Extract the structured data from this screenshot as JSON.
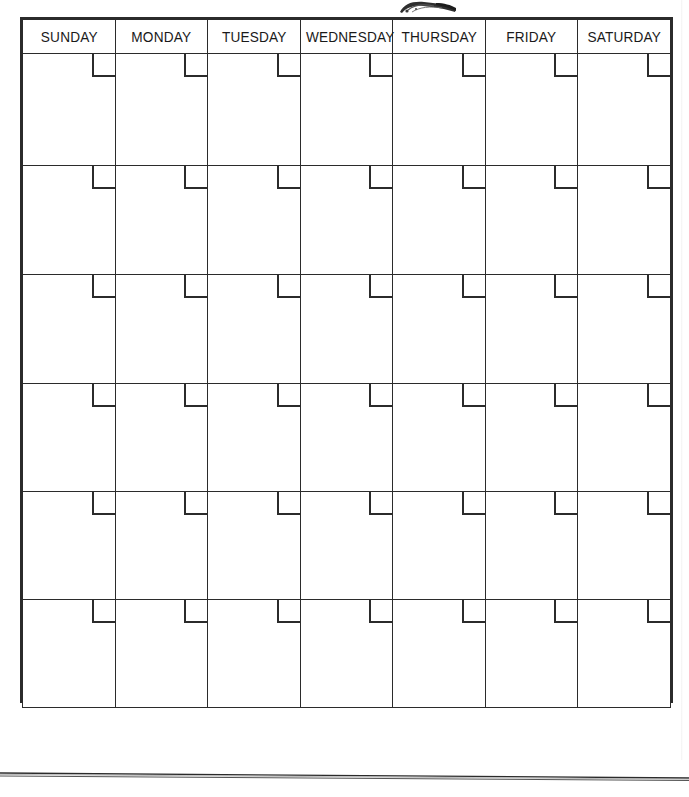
{
  "document": {
    "type": "blank-monthly-calendar",
    "title": "Blank Monthly Calendar Template"
  },
  "calendar": {
    "day_headers": [
      "SUNDAY",
      "MONDAY",
      "TUESDAY",
      "WEDNESDAY",
      "THURSDAY",
      "FRIDAY",
      "SATURDAY"
    ],
    "week_count": 6,
    "weeks": [
      {
        "cells": [
          "",
          "",
          "",
          "",
          "",
          "",
          ""
        ]
      },
      {
        "cells": [
          "",
          "",
          "",
          "",
          "",
          "",
          ""
        ]
      },
      {
        "cells": [
          "",
          "",
          "",
          "",
          "",
          "",
          ""
        ]
      },
      {
        "cells": [
          "",
          "",
          "",
          "",
          "",
          "",
          ""
        ]
      },
      {
        "cells": [
          "",
          "",
          "",
          "",
          "",
          "",
          ""
        ]
      },
      {
        "cells": [
          "",
          "",
          "",
          "",
          "",
          "",
          ""
        ]
      }
    ]
  },
  "artifacts": {
    "smudge_label": "scan-smudge",
    "ghost_marks": [
      "",
      "",
      "",
      ""
    ],
    "bottom_line_label": "scan-edge-line"
  },
  "colors": {
    "page_background": "#ffffff",
    "grid_line": "#2b2b2b",
    "text": "#1a1a1a",
    "ghost": "#d9d9d9"
  }
}
